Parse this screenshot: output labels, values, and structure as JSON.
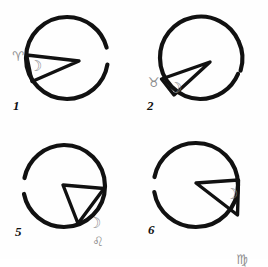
{
  "sheet": {
    "title": "Hand-drawn lunar sector diagrams",
    "background_color": "#fefefe",
    "ink_color": "#111111",
    "glyph_color": "#8d8d8d",
    "panel_count": 4
  },
  "panels": [
    {
      "number": "1",
      "sign_glyph": "♈",
      "sign_name": "aries",
      "moon_glyph": "☽",
      "moon_name": "crescent-moon",
      "wedge": {
        "apex_x": 79,
        "apex_y": 61,
        "start_angle_deg": 176,
        "end_angle_deg": 208,
        "description": "narrow wedge opening to the left"
      },
      "circle": {
        "cx": 67,
        "cy": 58,
        "r": 41,
        "gap_start_deg": 340,
        "gap_end_deg": 352
      }
    },
    {
      "number": "2",
      "sign_glyph": "♉",
      "sign_name": "taurus",
      "moon_glyph": "☽",
      "moon_name": "crescent-moon",
      "wedge": {
        "apex_x": 76,
        "apex_y": 62,
        "start_angle_deg": 196,
        "end_angle_deg": 230,
        "description": "narrow wedge opening to the lower left"
      },
      "circle": {
        "cx": 66,
        "cy": 58,
        "r": 41,
        "gap_start_deg": 352,
        "gap_end_deg": 6
      }
    },
    {
      "number": "5",
      "sign_glyph": "♌",
      "sign_name": "leo",
      "moon_glyph": "☽",
      "moon_name": "crescent-moon",
      "wedge": {
        "apex_x": 63,
        "apex_y": 55,
        "start_angle_deg": 356,
        "end_angle_deg": 62,
        "description": "wedge opening to the lower right"
      },
      "circle": {
        "cx": 64,
        "cy": 56,
        "r": 41,
        "gap_start_deg": 300,
        "gap_end_deg": 312
      }
    },
    {
      "number": "6",
      "sign_glyph": "♍",
      "sign_name": "virgo",
      "moon_glyph": "☽",
      "moon_name": "crescent-moon",
      "wedge": {
        "apex_x": 62,
        "apex_y": 53,
        "start_angle_deg": 352,
        "end_angle_deg": 46,
        "description": "wide wedge opening to the right, pac-man style"
      },
      "circle": {
        "cx": 62,
        "cy": 55,
        "r": 42,
        "gap_start_deg": 170,
        "gap_end_deg": 182
      }
    }
  ]
}
